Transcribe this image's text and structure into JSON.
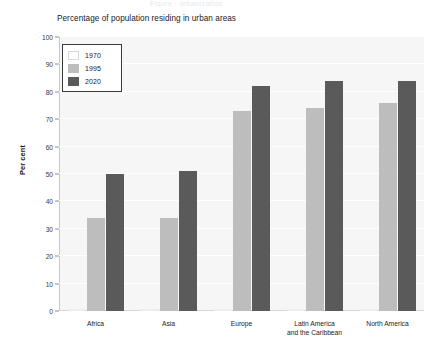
{
  "page": {
    "cut_top_text": "Figure  ·  urbanization"
  },
  "chart_data": {
    "type": "bar",
    "title": "Percentage of population residing in urban areas",
    "xlabel": "",
    "ylabel": "Per cent",
    "ylim": [
      0,
      100
    ],
    "ytick_step": 10,
    "yticks": [
      "100",
      "90",
      "80",
      "70",
      "60",
      "50",
      "40",
      "30",
      "20",
      "10",
      "0"
    ],
    "grid": true,
    "legend_position": "top-left",
    "categories": [
      "Africa",
      "Asia",
      "Europe",
      "Latin America\nand the Caribbean",
      "North America"
    ],
    "series": [
      {
        "name": "1970",
        "color": "#ffffff",
        "values": [
          0,
          0,
          0,
          0,
          0
        ]
      },
      {
        "name": "1995",
        "color": "#bdbdbd",
        "values": [
          34,
          34,
          73,
          74,
          76
        ]
      },
      {
        "name": "2020",
        "color": "#5a5a5a",
        "values": [
          50,
          51,
          82,
          84,
          84
        ]
      }
    ]
  }
}
